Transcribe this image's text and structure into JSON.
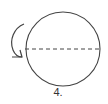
{
  "figure": {
    "label": "4.",
    "shape": "circle",
    "axis": "dashed horizontal diameter",
    "arrow": "curved rotation arrow on left",
    "stroke_color": "#444444"
  }
}
